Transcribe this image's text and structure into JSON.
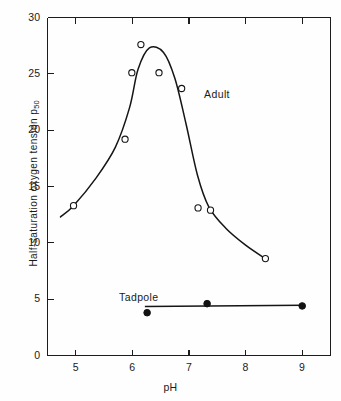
{
  "chart_data": {
    "type": "scatter",
    "title": "",
    "xlabel": "pH",
    "ylabel": "Half-saturation oxygen tension p50",
    "ylabel_main": "Half-saturation oxygen tension p",
    "ylabel_sub": "50",
    "xlim": [
      4.5,
      9.5
    ],
    "ylim": [
      0,
      30
    ],
    "xticks": [
      5,
      6,
      7,
      8,
      9
    ],
    "yticks": [
      0,
      5,
      10,
      15,
      20,
      25,
      30
    ],
    "xtick_labels": [
      "5",
      "6",
      "7",
      "8",
      "9"
    ],
    "ytick_labels": [
      "0",
      "5",
      "10",
      "15",
      "20",
      "25",
      "30"
    ],
    "grid": false,
    "legend": "inline-annotations",
    "series": [
      {
        "name": "Adult",
        "marker": "open-circle",
        "annotation": "Adult",
        "annotation_x": 7.25,
        "annotation_y": 23.5,
        "points": [
          {
            "x": 4.96,
            "y": 13.3
          },
          {
            "x": 5.87,
            "y": 19.2
          },
          {
            "x": 5.99,
            "y": 25.1
          },
          {
            "x": 6.15,
            "y": 27.6
          },
          {
            "x": 6.47,
            "y": 25.1
          },
          {
            "x": 6.87,
            "y": 23.7
          },
          {
            "x": 7.16,
            "y": 13.1
          },
          {
            "x": 7.38,
            "y": 12.9
          },
          {
            "x": 8.35,
            "y": 8.6
          }
        ],
        "fit_curve": [
          {
            "x": 4.73,
            "y": 12.3
          },
          {
            "x": 4.96,
            "y": 13.3
          },
          {
            "x": 5.35,
            "y": 15.7
          },
          {
            "x": 5.7,
            "y": 18.5
          },
          {
            "x": 5.95,
            "y": 22.0
          },
          {
            "x": 6.1,
            "y": 25.4
          },
          {
            "x": 6.3,
            "y": 27.3
          },
          {
            "x": 6.55,
            "y": 26.9
          },
          {
            "x": 6.75,
            "y": 24.6
          },
          {
            "x": 6.95,
            "y": 20.5
          },
          {
            "x": 7.15,
            "y": 16.0
          },
          {
            "x": 7.35,
            "y": 13.2
          },
          {
            "x": 7.65,
            "y": 11.3
          },
          {
            "x": 8.0,
            "y": 9.8
          },
          {
            "x": 8.35,
            "y": 8.6
          }
        ]
      },
      {
        "name": "Tadpole",
        "marker": "filled-circle",
        "annotation": "Tadpole",
        "annotation_x": 6.05,
        "annotation_y": 5.5,
        "points": [
          {
            "x": 6.26,
            "y": 3.8
          },
          {
            "x": 7.32,
            "y": 4.6
          },
          {
            "x": 9.0,
            "y": 4.4
          }
        ],
        "fit_curve": [
          {
            "x": 6.22,
            "y": 4.35
          },
          {
            "x": 7.32,
            "y": 4.55
          },
          {
            "x": 9.02,
            "y": 4.45
          }
        ]
      }
    ]
  }
}
